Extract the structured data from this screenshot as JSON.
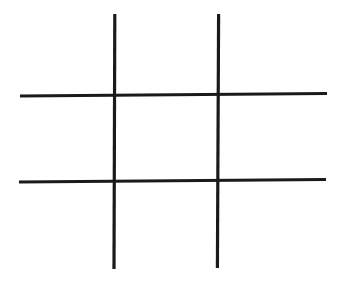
{
  "canvas": {
    "width": 340,
    "height": 281,
    "background_color": "#ffffff",
    "title": "Tic-Tac-Toe Grid"
  },
  "drawing": {
    "stroke_color": "#1a1a1a",
    "stroke_width": 3.2,
    "style": "hand-drawn",
    "lines": [
      {
        "name": "vertical-line-left",
        "orientation": "vertical",
        "x1": 114.8,
        "y1": 14.0,
        "x2": 114.0,
        "y2": 269.0
      },
      {
        "name": "vertical-line-right",
        "orientation": "vertical",
        "x1": 218.6,
        "y1": 14.0,
        "x2": 217.4,
        "y2": 268.0
      },
      {
        "name": "horizontal-line-top",
        "orientation": "horizontal",
        "x1": 20.0,
        "y1": 96.0,
        "x2": 327.0,
        "y2": 93.5
      },
      {
        "name": "horizontal-line-bottom",
        "orientation": "horizontal",
        "x1": 19.0,
        "y1": 182.0,
        "x2": 326.0,
        "y2": 179.5
      }
    ]
  },
  "grid": {
    "rows": 3,
    "columns": 3,
    "cells": [
      {
        "id": "cell-top-left",
        "row": 0,
        "col": 0,
        "mark": ""
      },
      {
        "id": "cell-top-center",
        "row": 0,
        "col": 1,
        "mark": ""
      },
      {
        "id": "cell-top-right",
        "row": 0,
        "col": 2,
        "mark": ""
      },
      {
        "id": "cell-middle-left",
        "row": 1,
        "col": 0,
        "mark": ""
      },
      {
        "id": "cell-middle-center",
        "row": 1,
        "col": 1,
        "mark": ""
      },
      {
        "id": "cell-middle-right",
        "row": 1,
        "col": 2,
        "mark": ""
      },
      {
        "id": "cell-bottom-left",
        "row": 2,
        "col": 0,
        "mark": ""
      },
      {
        "id": "cell-bottom-center",
        "row": 2,
        "col": 1,
        "mark": ""
      },
      {
        "id": "cell-bottom-right",
        "row": 2,
        "col": 2,
        "mark": ""
      }
    ]
  }
}
